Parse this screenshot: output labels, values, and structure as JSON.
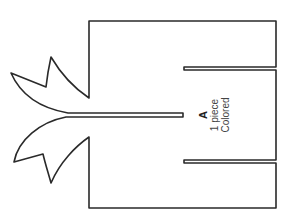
{
  "diagram": {
    "type": "pattern-piece",
    "piece": {
      "letter": "A",
      "quantity": "1 piece",
      "note": "Colored"
    },
    "stroke_color": "#2a2a2a",
    "background_color": "#ffffff"
  }
}
